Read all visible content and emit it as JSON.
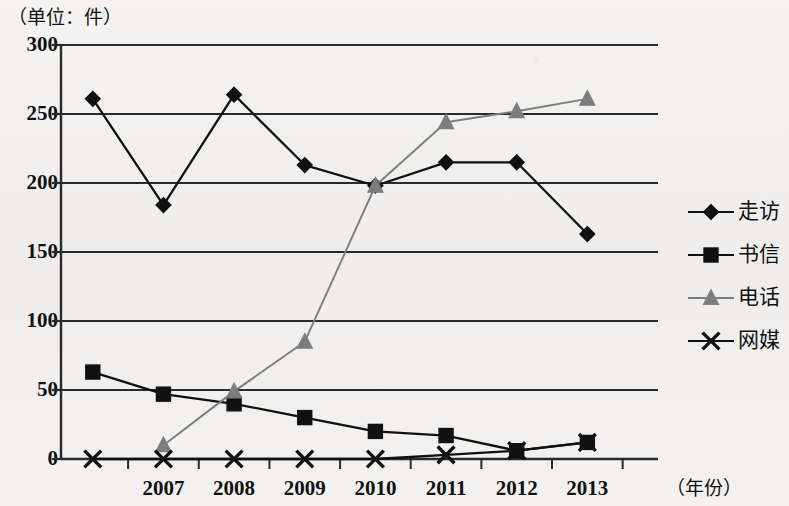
{
  "unit_label": "（单位：件）",
  "x_axis_title": "（年份）",
  "axis": {
    "y_ticks": [
      "0",
      "50",
      "100",
      "150",
      "200",
      "250",
      "300"
    ],
    "x_ticks": [
      "2007",
      "2008",
      "2009",
      "2010",
      "2011",
      "2012",
      "2013"
    ]
  },
  "legend": {
    "items": [
      {
        "label": "走访",
        "marker": "diamond-marker",
        "color": "#111111"
      },
      {
        "label": "书信",
        "marker": "square-marker",
        "color": "#111111"
      },
      {
        "label": "电话",
        "marker": "triangle-marker",
        "color": "#7d7d7d"
      },
      {
        "label": "网媒",
        "marker": "x-marker",
        "color": "#111111"
      }
    ]
  },
  "chart_data": {
    "type": "line",
    "title": "",
    "subtitle": "",
    "xlabel": "（年份）",
    "ylabel": "（单位：件）",
    "ylim": [
      0,
      300
    ],
    "yticks": [
      0,
      50,
      100,
      150,
      200,
      250,
      300
    ],
    "grid": true,
    "legend_position": "right",
    "x": [
      "2006",
      "2007",
      "2008",
      "2009",
      "2010",
      "2011",
      "2012",
      "2013"
    ],
    "x_tick_labels": [
      "",
      "2007",
      "2008",
      "2009",
      "2010",
      "2011",
      "2012",
      "2013"
    ],
    "series": [
      {
        "name": "走访",
        "marker": "diamond",
        "color": "#111111",
        "values": [
          261,
          184,
          264,
          213,
          198,
          215,
          215,
          163
        ]
      },
      {
        "name": "书信",
        "marker": "square",
        "color": "#111111",
        "values": [
          63,
          47,
          40,
          30,
          20,
          17,
          6,
          12
        ]
      },
      {
        "name": "电话",
        "marker": "triangle",
        "color": "#7d7d7d",
        "values": [
          null,
          10,
          49,
          85,
          198,
          244,
          252,
          261
        ]
      },
      {
        "name": "网媒",
        "marker": "x",
        "color": "#111111",
        "values": [
          0,
          0,
          0,
          0,
          0,
          3,
          6,
          12
        ]
      }
    ]
  }
}
